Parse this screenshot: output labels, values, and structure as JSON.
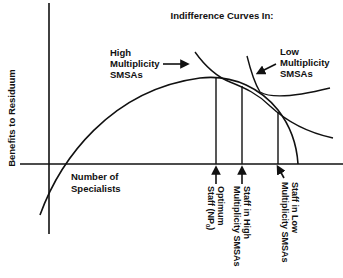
{
  "title": "Indifference Curves In:",
  "y_axis_label": "Benefits to Residuum",
  "x_axis_label": [
    "Number of",
    "Specialists"
  ],
  "curve_labels": {
    "high": [
      "High",
      "Multiplicity",
      "SMSAs"
    ],
    "low": [
      "Low",
      "Multiplicity",
      "SMSAs"
    ]
  },
  "staff_labels": {
    "optimum": [
      "Optimum",
      "Staff (NP",
      "0",
      ")"
    ],
    "high": [
      "Staff in High",
      "Multiplicity SMSAs"
    ],
    "low": [
      "Staff in Low",
      "Multiplicity SMSAs"
    ]
  },
  "colors": {
    "ink": "#111111",
    "background": "#ffffff"
  }
}
